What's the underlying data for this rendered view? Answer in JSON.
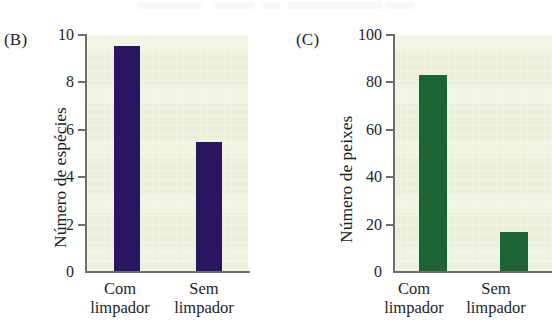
{
  "figure": {
    "background_color": "#ffffff",
    "plot_background_color": "#eaf0da",
    "axis_color": "#6d6d6d"
  },
  "panels": [
    {
      "letter": "(B)",
      "bar_color": "#2a1560",
      "chart_data": {
        "type": "bar",
        "title": "",
        "xlabel": "",
        "ylabel": "Número de espécies",
        "categories": [
          "Com limpador",
          "Sem limpador"
        ],
        "category_lines": [
          [
            "Com",
            "limpador"
          ],
          [
            "Sem",
            "limpador"
          ]
        ],
        "values": [
          9.55,
          5.5
        ],
        "ylim": [
          0,
          10
        ],
        "yticks": [
          0,
          2,
          4,
          6,
          8,
          10
        ],
        "ytick_labels": [
          "0",
          "2",
          "4",
          "6",
          "8",
          "10"
        ],
        "grid": false,
        "legend": "none"
      }
    },
    {
      "letter": "(C)",
      "bar_color": "#1c6434",
      "chart_data": {
        "type": "bar",
        "title": "",
        "xlabel": "",
        "ylabel": "Número de peixes",
        "categories": [
          "Com limpador",
          "Sem limpador"
        ],
        "category_lines": [
          [
            "Com",
            "limpador"
          ],
          [
            "Sem",
            "limpador"
          ]
        ],
        "values": [
          83,
          17
        ],
        "ylim": [
          0,
          100
        ],
        "yticks": [
          0,
          20,
          40,
          60,
          80,
          100
        ],
        "ytick_labels": [
          "0",
          "20",
          "40",
          "60",
          "80",
          "100"
        ],
        "grid": false,
        "legend": "none"
      }
    }
  ]
}
